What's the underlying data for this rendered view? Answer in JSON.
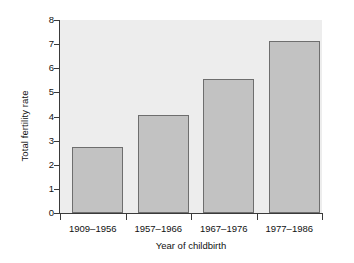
{
  "chart_data": {
    "type": "bar",
    "title": "",
    "subtitle": "",
    "xlabel": "Year of childbirth",
    "ylabel": "Total fertility rate",
    "categories": [
      "1909–1956",
      "1957–1966",
      "1967–1976",
      "1977–1986"
    ],
    "values": [
      2.75,
      4.05,
      5.57,
      7.12
    ],
    "ylim": [
      0,
      8
    ],
    "ytick_labels": [
      "0",
      "1",
      "2",
      "3",
      "4",
      "5",
      "6",
      "7",
      "8"
    ],
    "ytick_values": [
      0,
      1,
      2,
      3,
      4,
      5,
      6,
      7,
      8
    ],
    "grid": false,
    "legend": null,
    "legend_position": "none",
    "annotations": [],
    "series": [
      {
        "name": "Total fertility rate",
        "values": [
          2.75,
          4.05,
          5.57,
          7.12
        ]
      }
    ],
    "colors": {
      "bar_fill": "#c2c2c2",
      "bar_edge": "#6e6e6e",
      "plot_background": "#ededed",
      "figure_background": "#ffffff",
      "axis": "#3a3a3a",
      "text": "#111111"
    }
  }
}
